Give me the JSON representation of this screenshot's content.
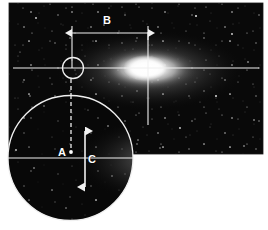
{
  "figure": {
    "kind": "astronomical-plate-with-inset",
    "background_color": "#ffffff",
    "sky_color": "#0a0a0a",
    "annotation_color": "#f2f2f2",
    "main_plate": {
      "name": "galaxy-field-plate",
      "x": 9,
      "y": 3,
      "width": 254,
      "height": 151,
      "subject": "edge-on spiral galaxy with bright nucleus"
    },
    "inset": {
      "name": "magnified-inset-circle",
      "center_x": 70.5,
      "center_y": 158,
      "radius": 62.5
    },
    "labels": [
      {
        "id": "A",
        "text": "A",
        "x": 63,
        "y": 156,
        "meaning": "point-marker-offset"
      },
      {
        "id": "B",
        "text": "B",
        "x": 107,
        "y": 20,
        "meaning": "horizontal-separation"
      },
      {
        "id": "C",
        "text": "C",
        "x": 91,
        "y": 161,
        "meaning": "vertical-separation"
      }
    ],
    "markers": {
      "circle_marker": {
        "name": "object-circle-marker",
        "cx": 73,
        "cy": 68,
        "r": 11
      },
      "point_marker": {
        "name": "object-point-marker",
        "cx": 71,
        "cy": 152,
        "r": 1.8
      },
      "crosshair": {
        "name": "nucleus-crosshair",
        "x": 148,
        "y": 68
      }
    },
    "measures": {
      "b_arrow": {
        "name": "b-dimension-arrow",
        "x1": 72,
        "x2": 148,
        "y": 33
      },
      "c_arrow": {
        "name": "c-dimension-arrow",
        "y1": 131,
        "y2": 187,
        "x": 85
      },
      "dashed_line": {
        "name": "a-projection-dashed-line",
        "x": 71,
        "y1": 79,
        "y2": 152
      },
      "main_axis": {
        "name": "major-axis-line",
        "y": 68,
        "x1": 13,
        "x2": 259
      },
      "inset_axis": {
        "name": "inset-major-axis-line",
        "y": 158,
        "x1": 9,
        "x2": 133
      }
    }
  }
}
